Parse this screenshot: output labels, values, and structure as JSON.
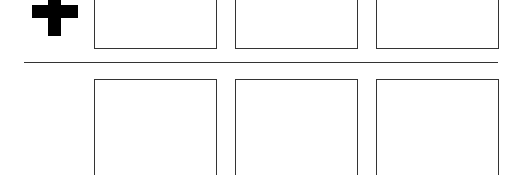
{
  "icons": {
    "plus": "plus-icon"
  },
  "colors": {
    "stroke": "#333333",
    "fill": "#ffffff",
    "icon": "#000000"
  },
  "rows": [
    {
      "name": "top-row",
      "boxes": [
        {
          "label": ""
        },
        {
          "label": ""
        },
        {
          "label": ""
        }
      ]
    },
    {
      "name": "bottom-row",
      "boxes": [
        {
          "label": ""
        },
        {
          "label": ""
        },
        {
          "label": ""
        }
      ]
    }
  ]
}
